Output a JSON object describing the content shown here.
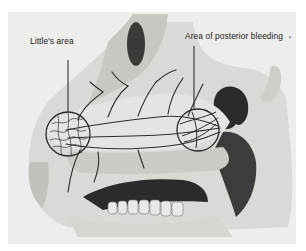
{
  "figure": {
    "style": "grayscale anatomical illustration",
    "labels": [
      {
        "id": "littles-area",
        "text": "Little's area"
      },
      {
        "id": "posterior-bleeding",
        "text": "Area of posterior bleeding"
      }
    ],
    "corner_mark": "•"
  },
  "colors": {
    "background": "#ffffff",
    "plate": "#ededeb",
    "tissue_light": "#dcdcd8",
    "tissue_mid": "#b9b9b4",
    "shadow": "#2a2a2a",
    "vessel": "#2e2e2e"
  }
}
